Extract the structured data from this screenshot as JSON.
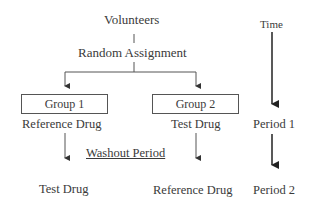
{
  "diagram": {
    "title_node": "Volunteers",
    "assignment": "Random Assignment",
    "groups": [
      {
        "label": "Group 1",
        "period1": "Reference Drug",
        "period2": "Test Drug"
      },
      {
        "label": "Group 2",
        "period1": "Test Drug",
        "period2": "Reference Drug"
      }
    ],
    "washout": "Washout Period",
    "timeline": {
      "label": "Time",
      "periods": [
        "Period 1",
        "Period 2"
      ]
    }
  }
}
